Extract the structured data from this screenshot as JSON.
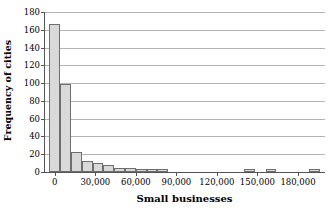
{
  "chart_data": {
    "type": "bar",
    "title": "",
    "subtitle": "",
    "xlabel": "Small businesses",
    "ylabel": "Frequency of cities",
    "grid": true,
    "legend": false,
    "legend_position": "none",
    "orientation": "vertical",
    "bar_color": "#d9d9d9",
    "bar_edge_color": "#6e6e6e",
    "grid_color": "#b4b4b4",
    "axis_color": "#555555",
    "xlim": [
      -8000,
      200000
    ],
    "ylim": [
      0,
      180
    ],
    "bin_width": 8000,
    "xticks": [
      0,
      30000,
      60000,
      90000,
      120000,
      150000,
      180000
    ],
    "xtick_labels": [
      "0",
      "30,000",
      "60,000",
      "90,000",
      "120,000",
      "150,000",
      "180,000"
    ],
    "yticks": [
      0,
      20,
      40,
      60,
      80,
      100,
      120,
      140,
      160,
      180
    ],
    "ytick_labels": [
      "0",
      "20",
      "40",
      "60",
      "80",
      "100",
      "120",
      "140",
      "160",
      "180"
    ],
    "bin_starts": [
      -4000,
      4000,
      12000,
      20000,
      28000,
      36000,
      44000,
      52000,
      60000,
      68000,
      76000,
      84000,
      92000,
      100000,
      108000,
      116000,
      124000,
      132000,
      140000,
      148000,
      156000,
      164000,
      172000,
      180000,
      188000
    ],
    "values": [
      166,
      99,
      22,
      12,
      10,
      8,
      5,
      4,
      3,
      3,
      3,
      0,
      0,
      0,
      0,
      0,
      0,
      0,
      3,
      0,
      3,
      0,
      0,
      0,
      3
    ],
    "categories": [
      "-4,000",
      "4,000",
      "12,000",
      "20,000",
      "28,000",
      "36,000",
      "44,000",
      "52,000",
      "60,000",
      "68,000",
      "76,000",
      "84,000",
      "92,000",
      "100,000",
      "108,000",
      "116,000",
      "124,000",
      "132,000",
      "140,000",
      "148,000",
      "156,000",
      "164,000",
      "172,000",
      "180,000",
      "188,000"
    ]
  }
}
